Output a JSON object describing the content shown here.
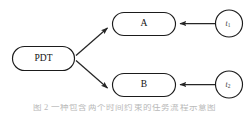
{
  "diagram": {
    "type": "flow-diagram",
    "background_color": "#ffffff",
    "stroke_color": "#1b1b1b",
    "arrow_color": "#262626",
    "nodes": [
      {
        "id": "pdt",
        "label": "PDT",
        "shape": "stadium",
        "x": 12,
        "y": 46,
        "width": 62,
        "height": 24
      },
      {
        "id": "a",
        "label": "A",
        "shape": "stadium",
        "x": 112,
        "y": 12,
        "width": 63,
        "height": 23
      },
      {
        "id": "b",
        "label": "B",
        "shape": "stadium",
        "x": 112,
        "y": 73,
        "width": 63,
        "height": 23
      },
      {
        "id": "t1",
        "label": "t",
        "subscript": "1",
        "shape": "circle",
        "cx": 229,
        "cy": 23,
        "r": 13.5
      },
      {
        "id": "t2",
        "label": "t",
        "subscript": "2",
        "shape": "circle",
        "cx": 229,
        "cy": 84,
        "r": 13.5
      }
    ],
    "edges": [
      {
        "id": "pdt-to-a",
        "from": "pdt",
        "to": "a",
        "direction": "up-right",
        "arrowhead": "to"
      },
      {
        "id": "pdt-to-b",
        "from": "pdt",
        "to": "b",
        "direction": "down-right",
        "arrowhead": "to"
      },
      {
        "id": "t1-to-a",
        "from": "t1",
        "to": "a",
        "direction": "left",
        "arrowhead": "to"
      },
      {
        "id": "t2-to-b",
        "from": "t2",
        "to": "b",
        "direction": "left",
        "arrowhead": "to"
      }
    ]
  },
  "caption": {
    "text": "图 2  一种包含两个时间约束的任务流程示意图"
  }
}
